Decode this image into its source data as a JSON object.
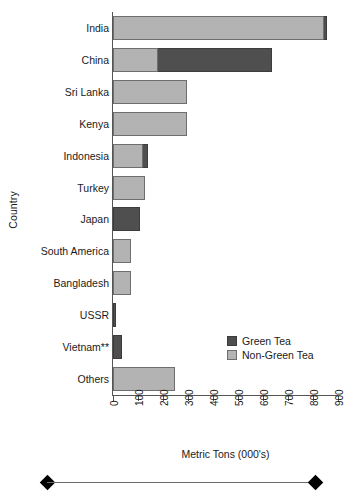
{
  "chart_data": {
    "type": "bar",
    "orientation": "horizontal",
    "stacked": true,
    "title": "",
    "xlabel": "Metric Tons (000's)",
    "ylabel": "Country",
    "xlim": [
      0,
      900
    ],
    "xticks": [
      0,
      100,
      200,
      300,
      400,
      500,
      600,
      700,
      800,
      900
    ],
    "xtick_labels": [
      "0",
      "100",
      "200",
      "300",
      "400",
      "500",
      "600",
      "700",
      "800",
      "900"
    ],
    "grid": false,
    "legend_position": "center-right-inside",
    "categories": [
      "India",
      "China",
      "Sri Lanka",
      "Kenya",
      "Indonesia",
      "Turkey",
      "Japan",
      "South America",
      "Bangladesh",
      "USSR",
      "Vietnam**",
      "Others"
    ],
    "series": [
      {
        "name": "Non-Green Tea",
        "color": "#b3b3b3",
        "values": [
          845,
          180,
          296,
          296,
          120,
          128,
          0,
          72,
          72,
          0,
          0,
          248
        ]
      },
      {
        "name": "Green Tea",
        "color": "#4f4f4f",
        "values": [
          12,
          456,
          0,
          0,
          20,
          0,
          108,
          0,
          0,
          12,
          36,
          0
        ]
      }
    ],
    "totals": [
      857,
      636,
      296,
      296,
      140,
      128,
      108,
      72,
      72,
      12,
      36,
      248
    ],
    "series_order_in_bar": [
      "Non-Green Tea",
      "Green Tea"
    ],
    "annotations": [
      "** double asterisk footnote marker on Vietnam"
    ]
  },
  "legend": {
    "items": [
      {
        "label": "Green Tea",
        "swatch": "green"
      },
      {
        "label": "Non-Green Tea",
        "swatch": "nongreen"
      }
    ]
  },
  "axes": {
    "x_title": "Metric Tons (000's)",
    "y_title": "Country"
  },
  "decoration": {
    "left_diamond": "diamond-marker",
    "right_diamond": "diamond-marker"
  }
}
